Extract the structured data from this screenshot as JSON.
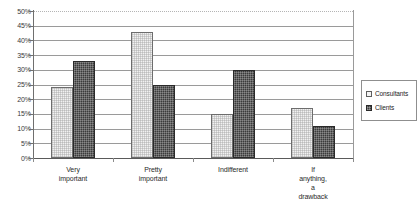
{
  "chart_data": {
    "type": "bar",
    "title": "",
    "xlabel": "",
    "ylabel": "",
    "ylim": [
      0,
      50
    ],
    "ytick_step": 5,
    "grid": true,
    "legend_position": "right",
    "categories": [
      "Very important",
      "Pretty important",
      "Indifferent",
      "If anything, a drawback"
    ],
    "category_lines": [
      [
        "Very",
        "important"
      ],
      [
        "Pretty",
        "important"
      ],
      [
        "Indifferent"
      ],
      [
        "If",
        "anything,",
        "a",
        "drawback"
      ]
    ],
    "series": [
      {
        "name": "Consultants",
        "values": [
          24,
          43,
          15,
          17
        ],
        "color": "#f1f1f1"
      },
      {
        "name": "Clients",
        "values": [
          33,
          25,
          30,
          11
        ],
        "color": "#3b3b3b"
      }
    ],
    "ytick_labels": [
      "50%",
      "45%",
      "40%",
      "35%",
      "30%",
      "25%",
      "20%",
      "15%",
      "10%",
      "5%",
      "0%"
    ],
    "ytick_values": [
      50,
      45,
      40,
      35,
      30,
      25,
      20,
      15,
      10,
      5,
      0
    ]
  },
  "legend": {
    "items": [
      {
        "label": "Consultants",
        "swatch": "light"
      },
      {
        "label": "Clients",
        "swatch": "dark"
      }
    ]
  }
}
